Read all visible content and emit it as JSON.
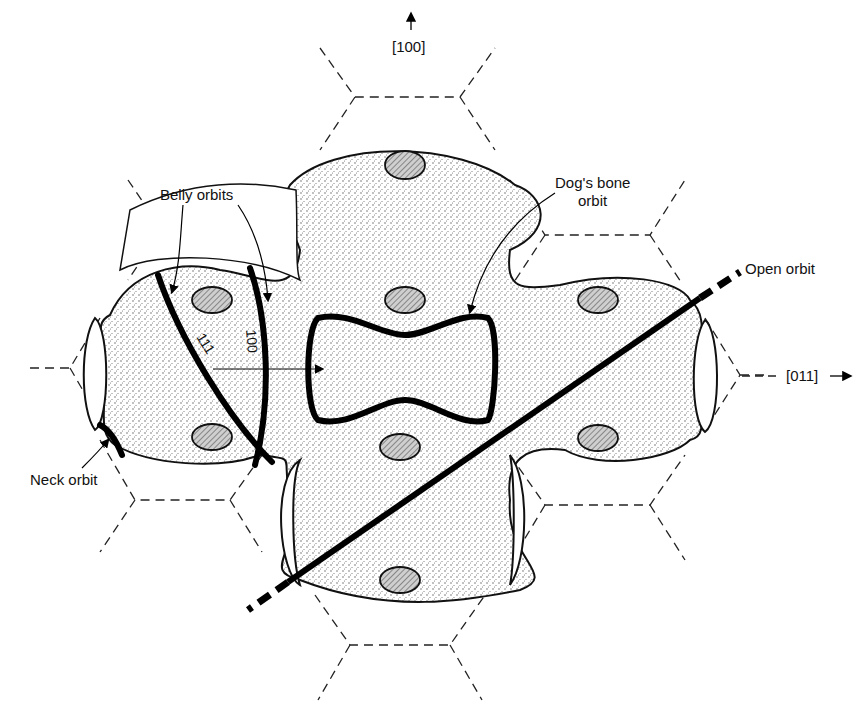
{
  "figure": {
    "axes": {
      "vertical_label": "[100]",
      "horizontal_label": "[011]"
    },
    "labels": {
      "belly_orbits": "Belly orbits",
      "dogs_bone_line1": "Dog's bone",
      "dogs_bone_line2": "orbit",
      "open_orbit": "Open orbit",
      "neck_orbit": "Neck orbit",
      "orbit_111": "111",
      "orbit_100": "100"
    },
    "legend_semantics": {
      "stippled_region": "occupied Fermi sphere region",
      "hatched_ovals": "necks",
      "dashed_lines": "Brillouin zone boundaries"
    },
    "colors": {
      "ink": "#111111",
      "background": "#ffffff"
    }
  }
}
